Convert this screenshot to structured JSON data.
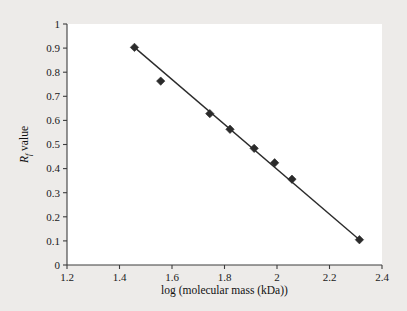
{
  "chart_data": {
    "type": "scatter",
    "title": "",
    "xlabel": "log (molecular mass (kDa))",
    "ylabel": "Rf value",
    "ylabel_base": "R",
    "ylabel_sub": "f",
    "ylabel_rest": " value",
    "xlim": [
      1.2,
      2.4
    ],
    "ylim": [
      0,
      1
    ],
    "xticks": [
      1.2,
      1.4,
      1.6,
      1.8,
      2.0,
      2.2,
      2.4
    ],
    "xtick_labels": [
      "1.2",
      "1.4",
      "1.6",
      "1.8",
      "2",
      "2.2",
      "2.4"
    ],
    "yticks": [
      0,
      0.1,
      0.2,
      0.3,
      0.4,
      0.5,
      0.6,
      0.7,
      0.8,
      0.9,
      1.0
    ],
    "ytick_labels": [
      "0",
      "0.1",
      "0.2",
      "0.3",
      "0.4",
      "0.5",
      "0.6",
      "0.7",
      "0.8",
      "0.9",
      "1"
    ],
    "grid": false,
    "legend": false,
    "marker": "diamond",
    "marker_color": "#2b2b2b",
    "line_color": "#2b2b2b",
    "background_color": "#edebe9",
    "plot_background_color": "#ffffff",
    "x": [
      1.457,
      1.557,
      1.744,
      1.821,
      1.913,
      1.991,
      2.057,
      2.314
    ],
    "y": [
      0.903,
      0.763,
      0.628,
      0.563,
      0.484,
      0.424,
      0.356,
      0.105
    ],
    "series": [
      {
        "name": "standards",
        "points": [
          {
            "x": 1.457,
            "y": 0.903
          },
          {
            "x": 1.557,
            "y": 0.763
          },
          {
            "x": 1.744,
            "y": 0.628
          },
          {
            "x": 1.821,
            "y": 0.563
          },
          {
            "x": 1.913,
            "y": 0.484
          },
          {
            "x": 1.991,
            "y": 0.424
          },
          {
            "x": 2.057,
            "y": 0.356
          },
          {
            "x": 2.314,
            "y": 0.105
          }
        ]
      }
    ],
    "fit_line": {
      "x1": 1.457,
      "y1": 0.903,
      "x2": 2.314,
      "y2": 0.105
    }
  }
}
